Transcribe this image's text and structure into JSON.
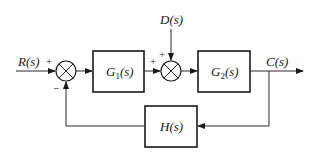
{
  "diagram": {
    "type": "control-system-block-diagram",
    "signals": {
      "input": "R(s)",
      "disturbance": "D(s)",
      "output": "C(s)"
    },
    "blocks": {
      "g1": {
        "label_main": "G",
        "label_sub": "1",
        "label_tail": "(s)"
      },
      "g2": {
        "label_main": "G",
        "label_sub": "2",
        "label_tail": "(s)"
      },
      "h": {
        "label": "H(s)"
      }
    },
    "summing_junctions": {
      "sum1": {
        "input_sign_reference": "+",
        "input_sign_feedback": "−"
      },
      "sum2": {
        "input_sign_forward": "+",
        "input_sign_disturbance": "+"
      }
    },
    "colors": {
      "line": "#2a2a2a",
      "background": "#ffffff"
    }
  }
}
